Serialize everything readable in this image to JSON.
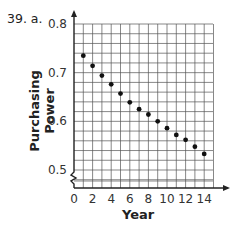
{
  "question_label": "39. a.",
  "chart_data": {
    "type": "scatter",
    "title": "",
    "xlabel": "Year",
    "ylabel": "Purchasing Power",
    "xlim": [
      0,
      15
    ],
    "ylim": [
      0.5,
      0.8
    ],
    "x_ticks": [
      0,
      2,
      4,
      6,
      8,
      10,
      12,
      14
    ],
    "y_ticks": [
      0.5,
      0.6,
      0.7,
      0.8
    ],
    "y_axis_break": true,
    "grid": true,
    "x": [
      1,
      2,
      3,
      4,
      5,
      6,
      7,
      8,
      9,
      10,
      11,
      12,
      13,
      14
    ],
    "values": [
      0.735,
      0.714,
      0.694,
      0.676,
      0.657,
      0.639,
      0.625,
      0.614,
      0.6,
      0.586,
      0.572,
      0.562,
      0.548,
      0.533
    ]
  },
  "tick_labels": {
    "x": [
      "0",
      "2",
      "4",
      "6",
      "8",
      "10",
      "12",
      "14"
    ],
    "y": [
      "0.5",
      "0.6",
      "0.7",
      "0.8"
    ]
  }
}
